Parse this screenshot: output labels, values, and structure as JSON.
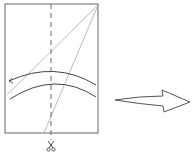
{
  "diagram": {
    "colors": {
      "frame": "#555555",
      "thin_lines": "#aaaaaa",
      "curves": "#444444",
      "dashed_line": "#666666",
      "arrow": "#555555"
    },
    "icons": [
      "scissors-icon",
      "right-arrow-icon"
    ]
  }
}
